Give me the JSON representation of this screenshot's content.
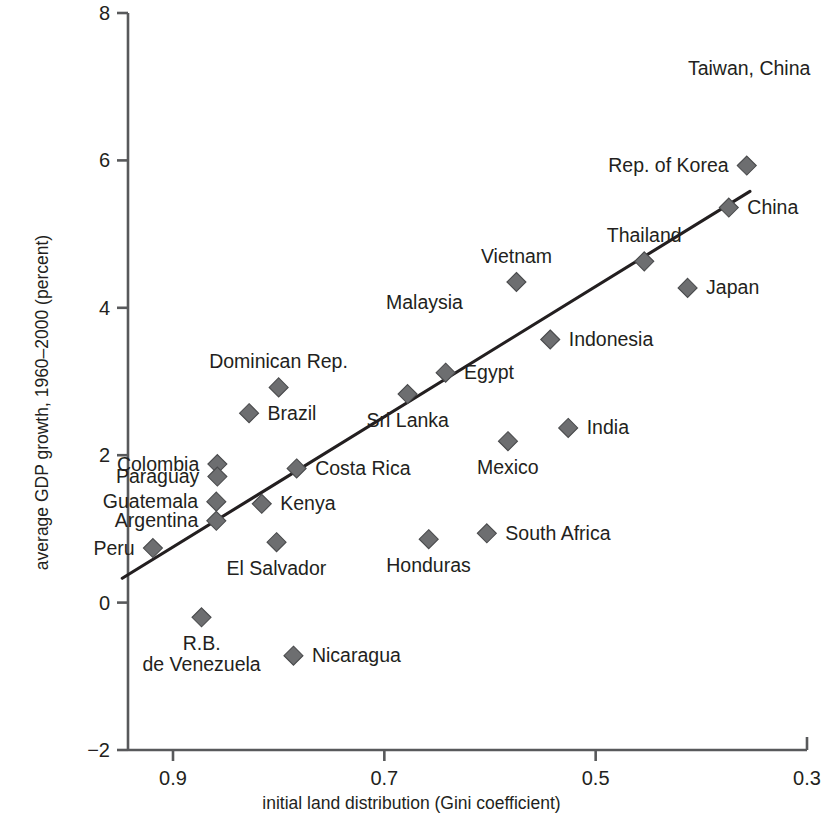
{
  "chart_data": {
    "type": "scatter",
    "title": "",
    "xlabel": "initial land distribution (Gini coefficient)",
    "ylabel": "average GDP growth, 1960–2000 (percent)",
    "xlim": [
      0.95,
      0.3
    ],
    "ylim": [
      -2,
      8
    ],
    "x_reversed": true,
    "grid": false,
    "legend": "none",
    "xticks": [
      "0.9",
      "0.7",
      "0.5",
      "0.3"
    ],
    "xtick_values": [
      0.9,
      0.7,
      0.5,
      0.3
    ],
    "yticks": [
      "8",
      "6",
      "4",
      "2",
      "0",
      "−2"
    ],
    "ytick_values": [
      8,
      6,
      4,
      2,
      0,
      -2
    ],
    "marker": "diamond",
    "marker_color": "#6d6e70",
    "trendline": {
      "present": true,
      "x_start": 0.948,
      "y_start": 0.33,
      "x_end": 0.354,
      "y_end": 5.58,
      "color": "#231f20"
    },
    "points": [
      {
        "label": "Taiwan, China",
        "x": 0.355,
        "y": 7.25,
        "marker": false,
        "label_pos": "center"
      },
      {
        "label": "Rep. of Korea",
        "x": 0.357,
        "y": 5.93,
        "marker": true,
        "label_pos": "left"
      },
      {
        "label": "China",
        "x": 0.374,
        "y": 5.36,
        "marker": true,
        "label_pos": "right"
      },
      {
        "label": "Thailand",
        "x": 0.454,
        "y": 4.63,
        "marker": true,
        "label_pos": "above"
      },
      {
        "label": "Vietnam",
        "x": 0.575,
        "y": 4.35,
        "marker": true,
        "label_pos": "above"
      },
      {
        "label": "Malaysia",
        "x": 0.662,
        "y": 4.07,
        "marker": false,
        "label_pos": "center"
      },
      {
        "label": "Japan",
        "x": 0.413,
        "y": 4.27,
        "marker": true,
        "label_pos": "right"
      },
      {
        "label": "Indonesia",
        "x": 0.543,
        "y": 3.57,
        "marker": true,
        "label_pos": "right"
      },
      {
        "label": "Egypt",
        "x": 0.642,
        "y": 3.12,
        "marker": true,
        "label_pos": "right"
      },
      {
        "label": "Dominican Rep.",
        "x": 0.8,
        "y": 2.92,
        "marker": true,
        "label_pos": "above"
      },
      {
        "label": "Sri Lanka",
        "x": 0.678,
        "y": 2.83,
        "marker": true,
        "label_pos": "below"
      },
      {
        "label": "Brazil",
        "x": 0.828,
        "y": 2.57,
        "marker": true,
        "label_pos": "right"
      },
      {
        "label": "India",
        "x": 0.526,
        "y": 2.37,
        "marker": true,
        "label_pos": "right"
      },
      {
        "label": "Mexico",
        "x": 0.583,
        "y": 2.19,
        "marker": true,
        "label_pos": "below"
      },
      {
        "label": "Colombia",
        "x": 0.858,
        "y": 1.88,
        "marker": true,
        "label_pos": "left"
      },
      {
        "label": "Costa Rica",
        "x": 0.783,
        "y": 1.82,
        "marker": true,
        "label_pos": "right"
      },
      {
        "label": "Paraguay",
        "x": 0.858,
        "y": 1.71,
        "marker": true,
        "label_pos": "left"
      },
      {
        "label": "Guatemala",
        "x": 0.859,
        "y": 1.37,
        "marker": true,
        "label_pos": "left"
      },
      {
        "label": "Kenya",
        "x": 0.816,
        "y": 1.34,
        "marker": true,
        "label_pos": "right"
      },
      {
        "label": "Argentina",
        "x": 0.859,
        "y": 1.11,
        "marker": true,
        "label_pos": "left"
      },
      {
        "label": "Peru",
        "x": 0.919,
        "y": 0.74,
        "marker": true,
        "label_pos": "left"
      },
      {
        "label": "El Salvador",
        "x": 0.802,
        "y": 0.82,
        "marker": true,
        "label_pos": "below"
      },
      {
        "label": "Honduras",
        "x": 0.658,
        "y": 0.86,
        "marker": true,
        "label_pos": "below"
      },
      {
        "label": "South Africa",
        "x": 0.603,
        "y": 0.94,
        "marker": true,
        "label_pos": "right"
      },
      {
        "label": "R.B.\nde Venezuela",
        "x": 0.873,
        "y": -0.2,
        "marker": true,
        "label_pos": "below"
      },
      {
        "label": "Nicaragua",
        "x": 0.786,
        "y": -0.72,
        "marker": true,
        "label_pos": "right"
      }
    ]
  }
}
